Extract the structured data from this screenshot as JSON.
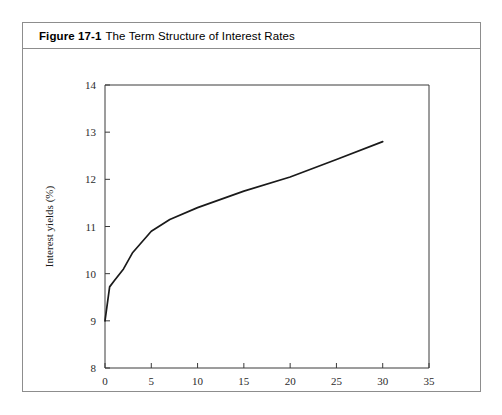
{
  "figure": {
    "number": "Figure 17-1",
    "title": "The Term Structure of Interest Rates"
  },
  "chart_data": {
    "type": "line",
    "title": "The Term Structure of Interest Rates",
    "xlabel": "Term to maturity (yrs)",
    "ylabel": "Interest yields (%)",
    "xlim": [
      0,
      35
    ],
    "ylim": [
      8,
      14
    ],
    "xticks": [
      0,
      5,
      10,
      15,
      20,
      25,
      30,
      35
    ],
    "xtick_labels": [
      "0",
      "5",
      "10",
      "15",
      "20",
      "25",
      "30",
      "35"
    ],
    "yticks": [
      8,
      9,
      10,
      11,
      12,
      13,
      14
    ],
    "ytick_labels": [
      "8",
      "9",
      "10",
      "11",
      "12",
      "13",
      "14"
    ],
    "grid": false,
    "legend": false,
    "series": [
      {
        "name": "Yield curve",
        "color": "#1a1a1a",
        "x": [
          0,
          0.5,
          1,
          2,
          3,
          5,
          7,
          10,
          15,
          20,
          25,
          30
        ],
        "y": [
          9.0,
          9.72,
          9.85,
          10.1,
          10.45,
          10.9,
          11.15,
          11.4,
          11.75,
          12.05,
          12.42,
          12.8
        ]
      }
    ]
  }
}
